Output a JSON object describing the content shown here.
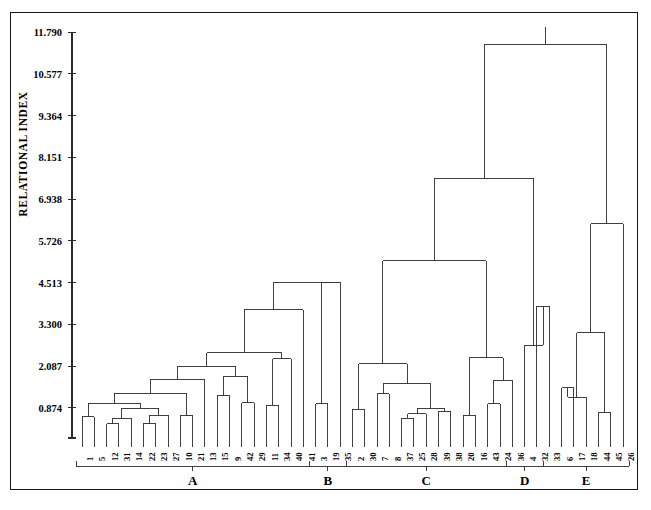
{
  "axis": {
    "y_title": "RELATIONAL INDEX",
    "ticks": [
      "11.790",
      "10.577",
      "9.364",
      "8.151",
      "6.938",
      "5.726",
      "4.513",
      "3.300",
      "2.087",
      "0.874"
    ],
    "tick_values": [
      11.79,
      10.577,
      9.364,
      8.151,
      6.938,
      5.726,
      4.513,
      3.3,
      2.087,
      0.874
    ]
  },
  "clusters": [
    {
      "letter": "A",
      "start": 0,
      "end": 18
    },
    {
      "letter": "B",
      "start": 19,
      "end": 21
    },
    {
      "letter": "C",
      "start": 22,
      "end": 34
    },
    {
      "letter": "D",
      "start": 35,
      "end": 37
    },
    {
      "letter": "E",
      "start": 38,
      "end": 44
    }
  ],
  "caption": "",
  "chart_data": {
    "type": "dendrogram",
    "title": "",
    "xlabel": "",
    "ylabel": "RELATIONAL INDEX",
    "ylim": [
      0,
      12.18
    ],
    "grid": false,
    "legend": "none",
    "leaf_labels": [
      "1",
      "5",
      "12",
      "31",
      "14",
      "22",
      "23",
      "27",
      "10",
      "21",
      "13",
      "15",
      "9",
      "42",
      "29",
      "11",
      "34",
      "40",
      "41",
      "3",
      "19",
      "35",
      "2",
      "30",
      "7",
      "8",
      "37",
      "25",
      "28",
      "39",
      "38",
      "20",
      "16",
      "43",
      "24",
      "36",
      "4",
      "32",
      "33",
      "6",
      "17",
      "18",
      "44",
      "45",
      "26"
    ],
    "cluster_letters": [
      "A",
      "B",
      "C",
      "D",
      "E"
    ],
    "cluster_members": {
      "A": [
        "1",
        "5",
        "12",
        "31",
        "14",
        "22",
        "23",
        "27",
        "10",
        "21",
        "13",
        "15",
        "9",
        "42",
        "29",
        "11",
        "34",
        "40",
        "41"
      ],
      "B": [
        "3",
        "19",
        "35"
      ],
      "C": [
        "2",
        "30",
        "7",
        "8",
        "37",
        "25",
        "28",
        "39",
        "38",
        "20",
        "16",
        "43",
        "24",
        "36"
      ],
      "D": [
        "4",
        "32",
        "33"
      ],
      "E": [
        "6",
        "17",
        "18",
        "44",
        "45",
        "26"
      ]
    },
    "axis_tick_labels": [
      "11.790",
      "10.577",
      "9.364",
      "8.151",
      "6.938",
      "5.726",
      "4.513",
      "3.300",
      "2.087",
      "0.874"
    ],
    "merges": [
      {
        "id": "m1",
        "left": "1",
        "right": "5",
        "height": 0.62
      },
      {
        "id": "m2",
        "left": "12",
        "right": "31",
        "height": 0.42
      },
      {
        "id": "m3",
        "left": "m2",
        "right": "14",
        "height": 0.58
      },
      {
        "id": "m4",
        "left": "22",
        "right": "23",
        "height": 0.42
      },
      {
        "id": "m5",
        "left": "m4",
        "right": "27",
        "height": 0.66
      },
      {
        "id": "m6",
        "left": "m3",
        "right": "m5",
        "height": 0.86
      },
      {
        "id": "m7",
        "left": "m1",
        "right": "m6",
        "height": 1.01
      },
      {
        "id": "m8",
        "left": "10",
        "right": "21",
        "height": 0.64
      },
      {
        "id": "m9",
        "left": "m7",
        "right": "m8",
        "height": 1.3
      },
      {
        "id": "m10",
        "left": "m9",
        "right": "13",
        "height": 1.7
      },
      {
        "id": "m11",
        "left": "15",
        "right": "9",
        "height": 1.22
      },
      {
        "id": "m12",
        "left": "42",
        "right": "29",
        "height": 1.02
      },
      {
        "id": "m13",
        "left": "m11",
        "right": "m12",
        "height": 1.79
      },
      {
        "id": "m14",
        "left": "m10",
        "right": "m13",
        "height": 2.08
      },
      {
        "id": "m15",
        "left": "11",
        "right": "34",
        "height": 0.95
      },
      {
        "id": "m16",
        "left": "m15",
        "right": "40",
        "height": 2.3
      },
      {
        "id": "m17",
        "left": "m14",
        "right": "m16",
        "height": 2.47
      },
      {
        "id": "m18",
        "left": "m17",
        "right": "41",
        "height": 3.73
      },
      {
        "id": "m19",
        "left": "3",
        "right": "19",
        "height": 1.0
      },
      {
        "id": "m20",
        "left": "m19",
        "right": "35",
        "height": 4.52
      },
      {
        "id": "m21",
        "left": "m18",
        "right": "m20",
        "height": 4.52
      },
      {
        "id": "m22",
        "left": "2",
        "right": "30",
        "height": 0.84
      },
      {
        "id": "m23",
        "left": "7",
        "right": "8",
        "height": 1.28
      },
      {
        "id": "m24",
        "left": "37",
        "right": "25",
        "height": 0.58
      },
      {
        "id": "m25",
        "left": "m24",
        "right": "28",
        "height": 0.7
      },
      {
        "id": "m26",
        "left": "39",
        "right": "38",
        "height": 0.78
      },
      {
        "id": "m27",
        "left": "m25",
        "right": "m26",
        "height": 0.87
      },
      {
        "id": "m28",
        "left": "m23",
        "right": "m27",
        "height": 1.58
      },
      {
        "id": "m29",
        "left": "m22",
        "right": "m28",
        "height": 2.15
      },
      {
        "id": "m30",
        "left": "20",
        "right": "16",
        "height": 0.66
      },
      {
        "id": "m31",
        "left": "43",
        "right": "24",
        "height": 1.0
      },
      {
        "id": "m32",
        "left": "m31",
        "right": "36",
        "height": 1.68
      },
      {
        "id": "m33",
        "left": "m30",
        "right": "m32",
        "height": 2.33
      },
      {
        "id": "m34",
        "left": "m29",
        "right": "m33",
        "height": 5.15
      },
      {
        "id": "m35",
        "left": "32",
        "right": "33",
        "height": 3.83
      },
      {
        "id": "m36",
        "left": "4",
        "right": "m35",
        "height": 2.7
      },
      {
        "id": "m37",
        "left": "m34",
        "right": "m36",
        "height": 7.54
      },
      {
        "id": "m38",
        "left": "6",
        "right": "17",
        "height": 1.46
      },
      {
        "id": "m39",
        "left": "m38",
        "right": "18",
        "height": 1.18
      },
      {
        "id": "m40",
        "left": "44",
        "right": "45",
        "height": 0.74
      },
      {
        "id": "m41",
        "left": "m39",
        "right": "m40",
        "height": 3.06
      },
      {
        "id": "m42",
        "left": "m41",
        "right": "26",
        "height": 6.22
      },
      {
        "id": "m43",
        "left": "m37",
        "right": "m42",
        "height": 11.42
      }
    ]
  }
}
